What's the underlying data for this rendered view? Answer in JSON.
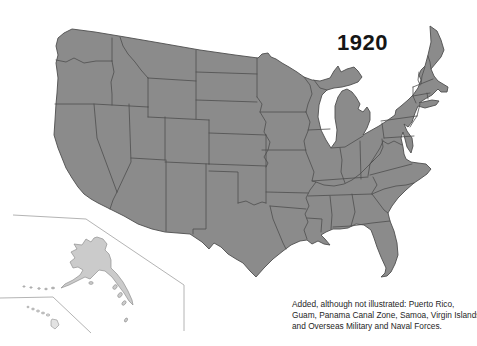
{
  "year_label": "1920",
  "caption": {
    "line1": "Added, although not illustrated: Puerto Rico,",
    "line2": "Guam, Panama Canal Zone, Samoa, Virgin Islands,",
    "line3": "and Overseas Military and Naval Forces."
  },
  "map": {
    "regions": {
      "mainland": "contiguous United States with state boundaries",
      "alaska": "Alaska (inset)",
      "hawaii": "Hawaii (inset)"
    },
    "colors": {
      "background": "#ffffff",
      "mainland_fill": "#8b8b8b",
      "mainland_stroke": "#4e4e4e",
      "state_border_stroke": "#4e4e4e",
      "alaska_fill": "#cbcbcb",
      "alaska_stroke": "#8f8f8f",
      "hawaii_fill": "#e3e3e3",
      "hawaii_stroke": "#8f8f8f",
      "inset_frame_stroke": "#b4b4b4",
      "text": "#161616",
      "caption_text": "#262626"
    }
  }
}
